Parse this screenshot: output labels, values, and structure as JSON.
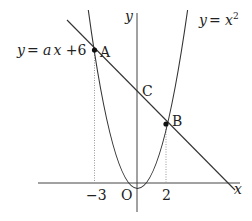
{
  "diagram": {
    "axes": {
      "x_label": "x",
      "y_label": "y",
      "origin_label": "O"
    },
    "curves": {
      "parabola_label": "y = x²",
      "parabola_lhs": "y",
      "parabola_eq": "= ",
      "parabola_var": "x",
      "parabola_exp": "2",
      "line_label": "y = ax + 6",
      "line_lhs": "y",
      "line_eq": "= ",
      "line_a": "a",
      "line_x": "x",
      "line_rest": " +6"
    },
    "points": [
      {
        "name": "A",
        "x": -3,
        "y": 9
      },
      {
        "name": "B",
        "x": 2,
        "y": 4
      },
      {
        "name": "C",
        "x": 0,
        "y": 6
      }
    ],
    "ticks": {
      "neg3": "−3",
      "pos2": "2"
    },
    "colors": {
      "stroke": "#333333",
      "dotted": "#888888"
    }
  }
}
